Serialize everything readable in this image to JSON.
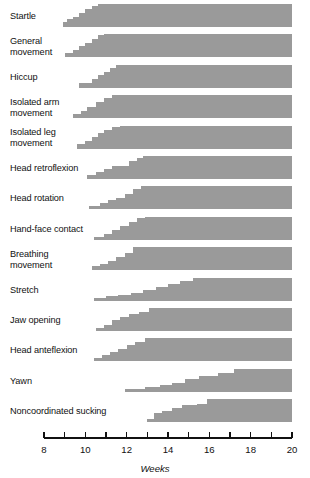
{
  "chart_data": {
    "type": "area",
    "title": "",
    "subtitle": "",
    "xlabel": "Weeks",
    "ylabel": "",
    "xlim": [
      8,
      20
    ],
    "ylim": [
      0,
      100
    ],
    "grid": false,
    "legend": null,
    "x_ticks": [
      8,
      9,
      10,
      11,
      12,
      13,
      14,
      15,
      16,
      17,
      18,
      19,
      20
    ],
    "x_tick_labels": [
      "8",
      "",
      "10",
      "",
      "12",
      "",
      "14",
      "",
      "16",
      "",
      "18",
      "",
      "20"
    ],
    "fill_color": "#9a9a9a",
    "axis_color": "#111111",
    "categories": [
      "Startle",
      "General movement",
      "Hiccup",
      "Isolated arm movement",
      "Isolated leg movement",
      "Head retroflexion",
      "Head rotation",
      "Hand-face contact",
      "Breathing movement",
      "Stretch",
      "Jaw opening",
      "Head anteflexion",
      "Yawn",
      "Noncoordinated sucking"
    ],
    "series": [
      {
        "name": "Startle",
        "label_lines": [
          "Startle"
        ],
        "onset_week": 8.9,
        "steps": [
          {
            "week": 8.9,
            "value": 20
          },
          {
            "week": 9.1,
            "value": 33
          },
          {
            "week": 9.4,
            "value": 45
          },
          {
            "week": 9.7,
            "value": 62
          },
          {
            "week": 10.0,
            "value": 78
          },
          {
            "week": 10.3,
            "value": 92
          },
          {
            "week": 10.6,
            "value": 100
          },
          {
            "week": 20.0,
            "value": 100
          }
        ]
      },
      {
        "name": "General movement",
        "label_lines": [
          "General",
          "movement"
        ],
        "onset_week": 9.0,
        "steps": [
          {
            "week": 9.0,
            "value": 16
          },
          {
            "week": 9.4,
            "value": 30
          },
          {
            "week": 9.7,
            "value": 46
          },
          {
            "week": 10.0,
            "value": 62
          },
          {
            "week": 10.3,
            "value": 80
          },
          {
            "week": 10.6,
            "value": 95
          },
          {
            "week": 10.9,
            "value": 100
          },
          {
            "week": 20.0,
            "value": 100
          }
        ]
      },
      {
        "name": "Hiccup",
        "label_lines": [
          "Hiccup"
        ],
        "onset_week": 9.7,
        "steps": [
          {
            "week": 9.7,
            "value": 22
          },
          {
            "week": 10.3,
            "value": 38
          },
          {
            "week": 10.6,
            "value": 58
          },
          {
            "week": 10.9,
            "value": 70
          },
          {
            "week": 11.2,
            "value": 88
          },
          {
            "week": 11.5,
            "value": 100
          },
          {
            "week": 20.0,
            "value": 100
          }
        ]
      },
      {
        "name": "Isolated arm movement",
        "label_lines": [
          "Isolated arm",
          "movement"
        ],
        "onset_week": 9.4,
        "steps": [
          {
            "week": 9.4,
            "value": 18
          },
          {
            "week": 9.8,
            "value": 32
          },
          {
            "week": 10.1,
            "value": 50
          },
          {
            "week": 10.5,
            "value": 70
          },
          {
            "week": 10.9,
            "value": 88
          },
          {
            "week": 11.3,
            "value": 100
          },
          {
            "week": 20.0,
            "value": 100
          }
        ]
      },
      {
        "name": "Isolated leg movement",
        "label_lines": [
          "Isolated leg",
          "movement"
        ],
        "onset_week": 9.6,
        "steps": [
          {
            "week": 9.6,
            "value": 20
          },
          {
            "week": 10.0,
            "value": 36
          },
          {
            "week": 10.3,
            "value": 52
          },
          {
            "week": 10.6,
            "value": 68
          },
          {
            "week": 10.9,
            "value": 84
          },
          {
            "week": 11.3,
            "value": 96
          },
          {
            "week": 11.7,
            "value": 100
          },
          {
            "week": 20.0,
            "value": 100
          }
        ]
      },
      {
        "name": "Head retroflexion",
        "label_lines": [
          "Head retroflexion"
        ],
        "onset_week": 10.1,
        "steps": [
          {
            "week": 10.1,
            "value": 16
          },
          {
            "week": 10.5,
            "value": 30
          },
          {
            "week": 10.9,
            "value": 42
          },
          {
            "week": 11.3,
            "value": 55
          },
          {
            "week": 11.7,
            "value": 58
          },
          {
            "week": 12.1,
            "value": 78
          },
          {
            "week": 12.5,
            "value": 92
          },
          {
            "week": 12.8,
            "value": 100
          },
          {
            "week": 20.0,
            "value": 100
          }
        ]
      },
      {
        "name": "Head rotation",
        "label_lines": [
          "Head rotation"
        ],
        "onset_week": 10.2,
        "steps": [
          {
            "week": 10.2,
            "value": 14
          },
          {
            "week": 10.7,
            "value": 28
          },
          {
            "week": 11.1,
            "value": 38
          },
          {
            "week": 11.5,
            "value": 48
          },
          {
            "week": 11.9,
            "value": 66
          },
          {
            "week": 12.3,
            "value": 86
          },
          {
            "week": 12.7,
            "value": 100
          },
          {
            "week": 20.0,
            "value": 100
          }
        ]
      },
      {
        "name": "Hand-face contact",
        "label_lines": [
          "Hand-face contact"
        ],
        "onset_week": 10.4,
        "steps": [
          {
            "week": 10.4,
            "value": 14
          },
          {
            "week": 10.9,
            "value": 28
          },
          {
            "week": 11.3,
            "value": 44
          },
          {
            "week": 11.7,
            "value": 62
          },
          {
            "week": 12.1,
            "value": 80
          },
          {
            "week": 12.5,
            "value": 94
          },
          {
            "week": 12.9,
            "value": 100
          },
          {
            "week": 20.0,
            "value": 100
          }
        ]
      },
      {
        "name": "Breathing movement",
        "label_lines": [
          "Breathing",
          "movement"
        ],
        "onset_week": 10.3,
        "steps": [
          {
            "week": 10.3,
            "value": 16
          },
          {
            "week": 10.7,
            "value": 26
          },
          {
            "week": 11.1,
            "value": 40
          },
          {
            "week": 11.5,
            "value": 56
          },
          {
            "week": 11.9,
            "value": 76
          },
          {
            "week": 12.3,
            "value": 100
          },
          {
            "week": 20.0,
            "value": 100
          }
        ]
      },
      {
        "name": "Stretch",
        "label_lines": [
          "Stretch"
        ],
        "onset_week": 10.4,
        "steps": [
          {
            "week": 10.4,
            "value": 12
          },
          {
            "week": 11.0,
            "value": 22
          },
          {
            "week": 11.6,
            "value": 26
          },
          {
            "week": 12.2,
            "value": 36
          },
          {
            "week": 12.8,
            "value": 48
          },
          {
            "week": 13.4,
            "value": 62
          },
          {
            "week": 14.0,
            "value": 72
          },
          {
            "week": 14.6,
            "value": 86
          },
          {
            "week": 15.2,
            "value": 100
          },
          {
            "week": 20.0,
            "value": 100
          }
        ]
      },
      {
        "name": "Jaw opening",
        "label_lines": [
          "Jaw opening"
        ],
        "onset_week": 10.5,
        "steps": [
          {
            "week": 10.5,
            "value": 12
          },
          {
            "week": 10.9,
            "value": 26
          },
          {
            "week": 11.3,
            "value": 46
          },
          {
            "week": 11.7,
            "value": 62
          },
          {
            "week": 12.1,
            "value": 72
          },
          {
            "week": 12.6,
            "value": 84
          },
          {
            "week": 13.1,
            "value": 100
          },
          {
            "week": 20.0,
            "value": 100
          }
        ]
      },
      {
        "name": "Head anteflexion",
        "label_lines": [
          "Head anteflexion"
        ],
        "onset_week": 10.4,
        "steps": [
          {
            "week": 10.4,
            "value": 14
          },
          {
            "week": 10.8,
            "value": 26
          },
          {
            "week": 11.2,
            "value": 40
          },
          {
            "week": 11.6,
            "value": 54
          },
          {
            "week": 12.0,
            "value": 68
          },
          {
            "week": 12.4,
            "value": 84
          },
          {
            "week": 12.9,
            "value": 100
          },
          {
            "week": 20.0,
            "value": 100
          }
        ]
      },
      {
        "name": "Yawn",
        "label_lines": [
          "Yawn"
        ],
        "onset_week": 11.9,
        "steps": [
          {
            "week": 11.9,
            "value": 12
          },
          {
            "week": 12.9,
            "value": 20
          },
          {
            "week": 13.6,
            "value": 30
          },
          {
            "week": 14.2,
            "value": 40
          },
          {
            "week": 14.8,
            "value": 56
          },
          {
            "week": 15.5,
            "value": 70
          },
          {
            "week": 16.4,
            "value": 84
          },
          {
            "week": 17.2,
            "value": 100
          },
          {
            "week": 20.0,
            "value": 100
          }
        ]
      },
      {
        "name": "Noncoordinated sucking",
        "label_lines": [
          "Noncoordinated sucking"
        ],
        "onset_week": 13.0,
        "steps": [
          {
            "week": 13.0,
            "value": 12
          },
          {
            "week": 13.3,
            "value": 38
          },
          {
            "week": 13.7,
            "value": 50
          },
          {
            "week": 14.2,
            "value": 62
          },
          {
            "week": 14.7,
            "value": 72
          },
          {
            "week": 15.4,
            "value": 78
          },
          {
            "week": 15.9,
            "value": 100
          },
          {
            "week": 20.0,
            "value": 100
          }
        ]
      }
    ]
  }
}
